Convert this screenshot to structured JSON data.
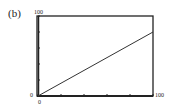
{
  "panel_label": "(b)",
  "chart_data": {
    "type": "line",
    "title": "",
    "xlabel": "",
    "ylabel": "",
    "xlim": [
      0,
      100
    ],
    "ylim": [
      0,
      100
    ],
    "tick_labels": {
      "x_min": "0",
      "x_max": "100",
      "y_min": "0",
      "y_max": "100"
    },
    "x_ticks": [
      0,
      20,
      40,
      60,
      80,
      100
    ],
    "y_ticks": [
      0,
      20,
      40,
      60,
      80,
      100
    ],
    "grid": false,
    "series": [
      {
        "name": "line",
        "x": [
          0,
          100
        ],
        "y": [
          0,
          80
        ]
      }
    ]
  }
}
